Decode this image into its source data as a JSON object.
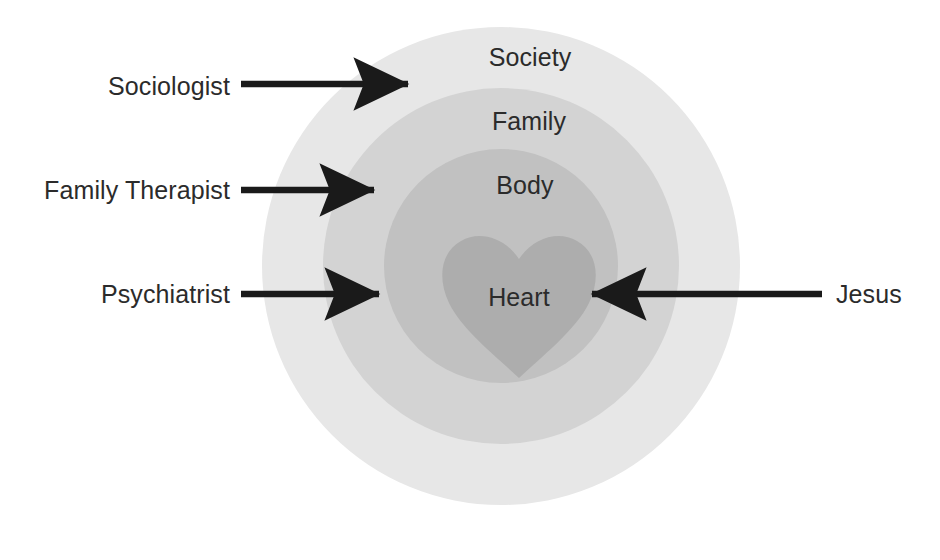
{
  "diagram": {
    "type": "concentric-circles",
    "title": "",
    "background_color": "#ffffff",
    "center": {
      "x": 501,
      "y": 266
    },
    "rings": [
      {
        "name": "society",
        "label": "Society",
        "radius": 239,
        "color": "#e7e7e7",
        "label_x": 530,
        "label_y": 57
      },
      {
        "name": "family",
        "label": "Family",
        "radius": 178,
        "color": "#d3d3d3",
        "label_x": 529,
        "label_y": 121
      },
      {
        "name": "body",
        "label": "Body",
        "radius": 117,
        "color": "#c1c1c1",
        "label_x": 525,
        "label_y": 185
      }
    ],
    "core": {
      "name": "heart",
      "label": "Heart",
      "shape": "heart",
      "color": "#adadad",
      "label_x": 519,
      "label_y": 297,
      "bounds": {
        "x": 443,
        "y": 237,
        "width": 152,
        "height": 141
      }
    },
    "arrow_color": "#1a1a1a",
    "annotations": [
      {
        "name": "sociologist",
        "label": "Sociologist",
        "side": "left",
        "direction": "right",
        "target_ring": "society",
        "label_x": 230,
        "label_y": 86,
        "arrow_start_x": 241,
        "arrow_end_x": 419,
        "arrow_y": 84
      },
      {
        "name": "family-therapist",
        "label": "Family Therapist",
        "side": "left",
        "direction": "right",
        "target_ring": "family",
        "label_x": 230,
        "label_y": 190,
        "arrow_start_x": 241,
        "arrow_end_x": 385,
        "arrow_y": 190
      },
      {
        "name": "psychiatrist",
        "label": "Psychiatrist",
        "side": "left",
        "direction": "right",
        "target_ring": "body",
        "label_x": 230,
        "label_y": 294,
        "arrow_start_x": 241,
        "arrow_end_x": 390,
        "arrow_y": 294
      },
      {
        "name": "jesus",
        "label": "Jesus",
        "side": "right",
        "direction": "left",
        "target_ring": "heart",
        "label_x": 836,
        "label_y": 294,
        "arrow_start_x": 822,
        "arrow_end_x": 581,
        "arrow_y": 294
      }
    ]
  }
}
